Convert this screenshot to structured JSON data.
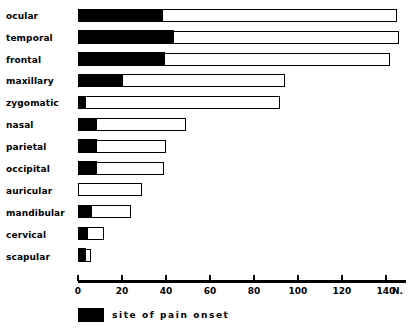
{
  "chart_data": {
    "type": "bar",
    "orientation": "horizontal",
    "stacked": true,
    "title": "",
    "subtitle": "",
    "xlabel": "N.",
    "ylabel": "",
    "xlim": [
      0,
      148
    ],
    "xticks": [
      0,
      20,
      40,
      60,
      80,
      100,
      120,
      140
    ],
    "xticklabels": [
      "0",
      "20",
      "40",
      "60",
      "80",
      "100",
      "120",
      "140"
    ],
    "axis_unit_label": "N.",
    "grid": false,
    "legend_position": "bottom-left",
    "categories": [
      "ocular",
      "temporal",
      "frontal",
      "maxillary",
      "zygomatic",
      "nasal",
      "parietal",
      "occipital",
      "auricular",
      "mandibular",
      "cervical",
      "scapular"
    ],
    "series": [
      {
        "name": "site of pain onset",
        "color": "#000000",
        "values": [
          38,
          43,
          39,
          20,
          3,
          8,
          8,
          8,
          0,
          6,
          4,
          3
        ]
      },
      {
        "name": "total",
        "color": "#ffffff",
        "values": [
          145,
          146,
          142,
          94,
          92,
          49,
          40,
          39,
          29,
          24,
          12,
          6
        ]
      }
    ],
    "legend": [
      {
        "label": "site  of  pain  onset",
        "color": "#000000"
      }
    ]
  },
  "colors": {
    "bar_fill": "#000000",
    "bar_empty": "#ffffff",
    "bar_stroke": "#000000",
    "background": "#ffffff",
    "text": "#000000"
  }
}
